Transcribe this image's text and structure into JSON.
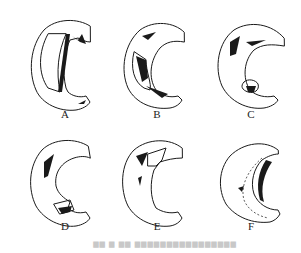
{
  "figure": {
    "panels": [
      {
        "id": "A",
        "label": "A"
      },
      {
        "id": "B",
        "label": "B"
      },
      {
        "id": "C",
        "label": "C"
      },
      {
        "id": "D",
        "label": "D"
      },
      {
        "id": "E",
        "label": "E"
      },
      {
        "id": "F",
        "label": "F"
      }
    ],
    "caption": "▆▆ ▆ ▆▆ ▆▆▆▆▆▆▆▆▆▆▆▆▆▆▆▆"
  }
}
